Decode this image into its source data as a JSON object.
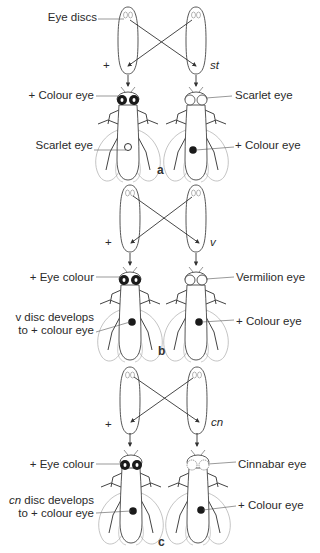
{
  "panels": [
    {
      "id": "a",
      "label": "a",
      "donor_left": "+",
      "donor_right": "st",
      "eye_discs_label": "Eye discs",
      "left_fly": {
        "head_label": "+ Colour eye",
        "implant_label_1": "Scarlet eye",
        "implant_label_2": "",
        "head_eye": "dark",
        "implant": "light"
      },
      "right_fly": {
        "head_label": "Scarlet eye",
        "implant_label": "+ Colour eye",
        "head_eye": "light",
        "implant": "dark"
      }
    },
    {
      "id": "b",
      "label": "b",
      "donor_left": "+",
      "donor_right": "v",
      "left_fly": {
        "head_label": "+ Eye colour",
        "implant_label_1": "v disc develops",
        "implant_label_2": "to + colour eye",
        "head_eye": "dark",
        "implant": "dark"
      },
      "right_fly": {
        "head_label": "Vermilion eye",
        "implant_label": "+ Colour eye",
        "head_eye": "light",
        "implant": "dark"
      }
    },
    {
      "id": "c",
      "label": "c",
      "donor_left": "+",
      "donor_right": "cn",
      "left_fly": {
        "head_label": "+ Eye colour",
        "implant_label_1_italic": "cn",
        "implant_label_1": " disc develops",
        "implant_label_2": "to + colour eye",
        "head_eye": "dark",
        "implant": "dark"
      },
      "right_fly": {
        "head_label": "Cinnabar eye",
        "implant_label": "+ Colour eye",
        "head_eye": "light",
        "implant": "dark"
      }
    }
  ],
  "colors": {
    "line": "#333333",
    "wing": "#9a9a9a",
    "dark_eye": "#1a1a1a"
  }
}
